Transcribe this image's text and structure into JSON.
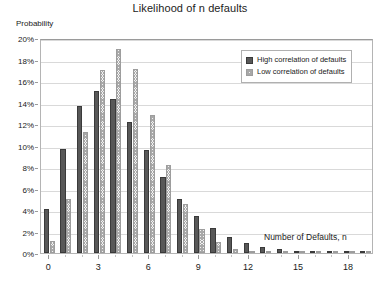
{
  "chart_data": {
    "type": "bar",
    "title": "Likelihood of n defaults",
    "xlabel": "Number of Defaults, n",
    "ylabel": "Probability",
    "categories": [
      0,
      1,
      2,
      3,
      4,
      5,
      6,
      7,
      8,
      9,
      10,
      11,
      12,
      13,
      14,
      15,
      16,
      17,
      18,
      19
    ],
    "series": [
      {
        "name": "High correlation of defaults",
        "color": "#585858",
        "pattern": "solid",
        "values": [
          4.1,
          9.65,
          13.7,
          15.1,
          14.3,
          12.2,
          9.6,
          7.1,
          5.05,
          3.45,
          2.3,
          1.5,
          0.95,
          0.6,
          0.33,
          0.2,
          0.12,
          0.07,
          0.04,
          0.02
        ]
      },
      {
        "name": "Low correlation of defaults",
        "color": "#d9d9d9",
        "pattern": "hatched",
        "values": [
          1.15,
          5.0,
          11.3,
          17.0,
          19.0,
          17.1,
          12.8,
          8.15,
          4.55,
          2.25,
          1.05,
          0.42,
          0.18,
          0.07,
          0.03,
          0.02,
          0.01,
          0.01,
          0.005,
          0.005
        ]
      }
    ],
    "ylim": [
      0,
      20
    ],
    "y_tick_values": [
      0,
      2,
      4,
      6,
      8,
      10,
      12,
      14,
      16,
      18,
      20
    ],
    "y_tick_labels": [
      "0%",
      "2%",
      "4%",
      "6%",
      "8%",
      "10%",
      "12%",
      "14%",
      "16%",
      "18%",
      "20%"
    ],
    "x_tick_values": [
      0,
      3,
      6,
      9,
      12,
      15,
      18
    ],
    "x_tick_labels": [
      "0",
      "3",
      "6",
      "9",
      "12",
      "15",
      "18"
    ],
    "grid": "horizontal",
    "legend_position": "upper-right",
    "units": "percent"
  }
}
